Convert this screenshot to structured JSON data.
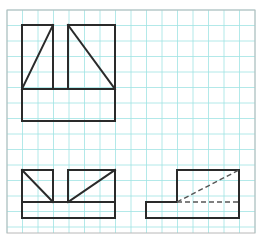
{
  "drawing": {
    "type": "orthographic-projection",
    "colors": {
      "background": "#ffffff",
      "grid": "#9fe3e3",
      "frame": "#b8b8b8",
      "object_line": "#2a2a2a",
      "hidden_line": "#555555"
    },
    "frame": {
      "x": 7,
      "y": 10,
      "width": 248,
      "height": 223
    },
    "grid": {
      "origin_x": 7,
      "origin_y": 10,
      "cell": 15.5,
      "cols": 16,
      "rows": 14
    },
    "views": {
      "top_view": {
        "outline": "22,25 53,25 53,89 68,89 68,25 115,25 115,121 22,121 22,25",
        "lines": [
          {
            "x1": 22,
            "y1": 89,
            "x2": 53,
            "y2": 89
          },
          {
            "x1": 22,
            "y1": 89,
            "x2": 53,
            "y2": 25
          },
          {
            "x1": 68,
            "y1": 89,
            "x2": 68,
            "y2": 25
          },
          {
            "x1": 68,
            "y1": 89,
            "x2": 115,
            "y2": 89
          },
          {
            "x1": 68,
            "y1": 25,
            "x2": 115,
            "y2": 89
          }
        ]
      },
      "front_view": {
        "outline": "22,170 53,170 53,202 68,202 68,170 115,170 115,218 22,218 22,170",
        "lines": [
          {
            "x1": 22,
            "y1": 202,
            "x2": 115,
            "y2": 202
          },
          {
            "x1": 22,
            "y1": 170,
            "x2": 53,
            "y2": 202
          },
          {
            "x1": 68,
            "y1": 202,
            "x2": 115,
            "y2": 170
          }
        ]
      },
      "side_view": {
        "outline": "146,202 177,202 177,170 239,170 239,218 146,218 146,202",
        "hidden_lines": [
          {
            "x1": 177,
            "y1": 202,
            "x2": 239,
            "y2": 170
          },
          {
            "x1": 177,
            "y1": 202,
            "x2": 239,
            "y2": 202
          }
        ]
      }
    }
  }
}
